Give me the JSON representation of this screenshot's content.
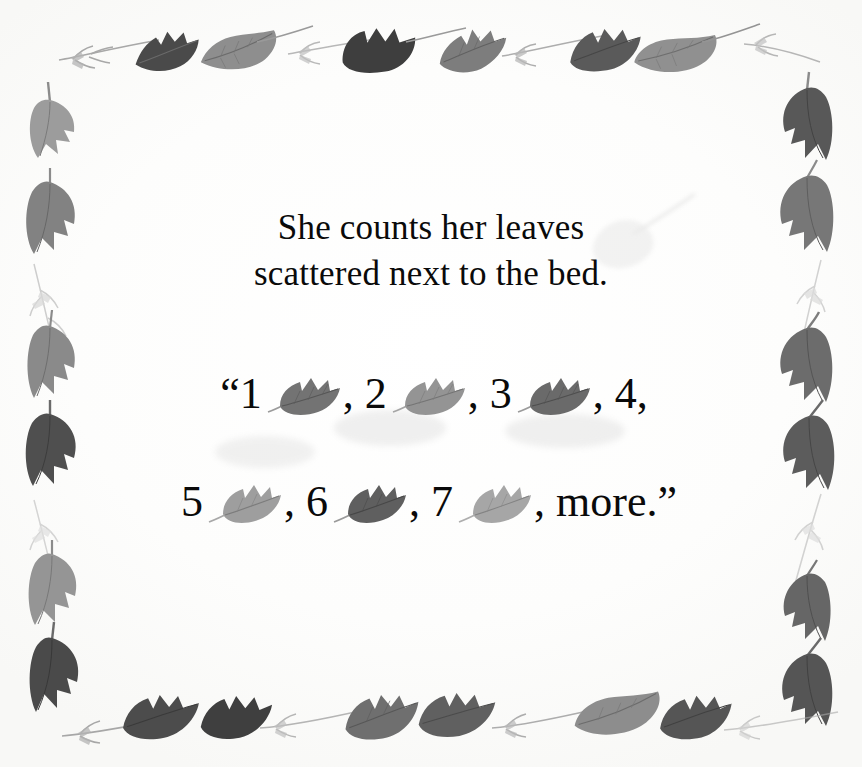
{
  "page": {
    "background_color": "#fdfdfc",
    "text_color": "#0a0a0a"
  },
  "verse": {
    "line1": "She counts her leaves",
    "line2": "scattered next to the bed."
  },
  "counting": {
    "line1": {
      "open_quote": "“",
      "items": [
        {
          "number": "1",
          "separator": ", ",
          "has_leaf": true
        },
        {
          "number": "2",
          "separator": ", ",
          "has_leaf": true
        },
        {
          "number": "3",
          "separator": ", ",
          "has_leaf": true
        },
        {
          "number": "4",
          "separator": ",",
          "has_leaf": false
        }
      ]
    },
    "line2": {
      "items": [
        {
          "number": "5",
          "separator": ",  ",
          "has_leaf": true
        },
        {
          "number": "6",
          "separator": ",  ",
          "has_leaf": true
        },
        {
          "number": "7",
          "separator": ",  ",
          "has_leaf": true
        }
      ],
      "final_word": "more.",
      "close_quote": "”"
    }
  },
  "counting_flat": {
    "l1_q": "“",
    "l1_n1": "1",
    "l1_s1": ", ",
    "l1_n2": "2",
    "l1_s2": ", ",
    "l1_n3": "3",
    "l1_s3": ", ",
    "l1_n4": "4,",
    "l2_n5": "5",
    "l2_s5": ",  ",
    "l2_n6": "6",
    "l2_s6": ",  ",
    "l2_n7": "7",
    "l2_s7": ",  ",
    "l2_more": "more.",
    "l2_q": "”"
  },
  "decoration": {
    "icon_name": "leaf-icon",
    "style": "watercolor-grayscale",
    "leaf_colors": {
      "darkest": "#3a3a3a",
      "dark": "#565656",
      "mid": "#787878",
      "light": "#a2a2a2",
      "lightest": "#c8c8c8",
      "twig": "#8d8d8d"
    },
    "border_description": "grayscale watercolor oak and maple leaves on thin twigs framing all four edges"
  }
}
